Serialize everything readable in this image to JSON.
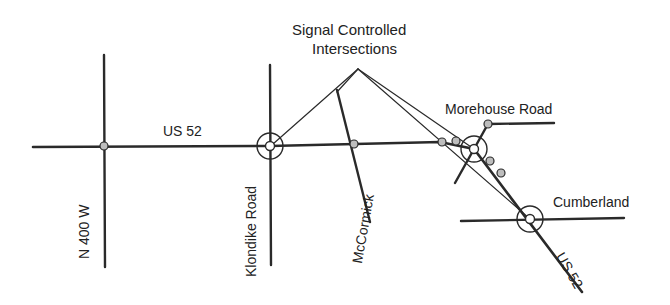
{
  "callout": {
    "line1": "Signal Controlled",
    "line2": "Intersections"
  },
  "roads": {
    "us52_top": "US 52",
    "us52_bottom": "US 52",
    "n400w": "N 400 W",
    "klondike": "Klondike Road",
    "mccormick": "McCormick",
    "morehouse": "Morehouse Road",
    "cumberland": "Cumberland"
  },
  "colors": {
    "line": "#2a2a2a",
    "node_fill": "#bdbdbd",
    "background": "#ffffff"
  }
}
